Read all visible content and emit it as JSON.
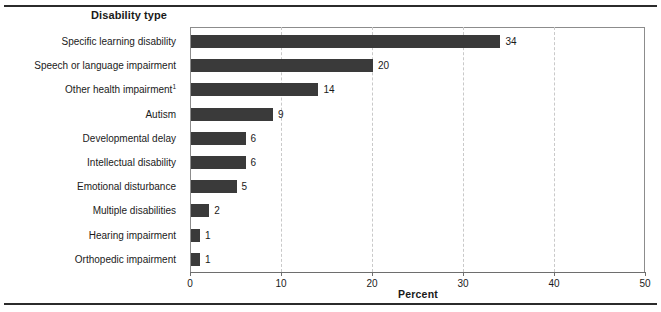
{
  "chart_data": {
    "type": "bar",
    "orientation": "horizontal",
    "title": "Disability type",
    "xlabel": "Percent",
    "ylabel": "Disability type",
    "xlim": [
      0,
      50
    ],
    "xticks": [
      0,
      10,
      20,
      30,
      40,
      50
    ],
    "xtick_labels": [
      "0",
      "10",
      "20",
      "30",
      "40",
      "50"
    ],
    "grid": "vertical-dashed",
    "legend": "none",
    "bar_color": "#3a3a3a",
    "categories": [
      "Specific learning disability",
      "Speech or language impairment",
      "Other health impairment",
      "Autism",
      "Developmental delay",
      "Intellectual disability",
      "Emotional disturbance",
      "Multiple disabilities",
      "Hearing impairment",
      "Orthopedic impairment"
    ],
    "values": [
      34,
      20,
      14,
      9,
      6,
      6,
      5,
      2,
      1,
      1
    ],
    "value_labels": [
      "34",
      "20",
      "14",
      "9",
      "6",
      "6",
      "5",
      "2",
      "1",
      "1"
    ],
    "footnote_markers": [
      "",
      "",
      "1",
      "",
      "",
      "",
      "",
      "",
      "",
      ""
    ]
  },
  "axis": {
    "category_heading": "Disability type",
    "value_axis_title": "Percent"
  },
  "colors": {
    "bar": "#3a3a3a",
    "gridline": "#c9c9c9",
    "axis": "#6e6e6e",
    "rule": "#2b2b2b",
    "text": "#1a1a1a"
  }
}
